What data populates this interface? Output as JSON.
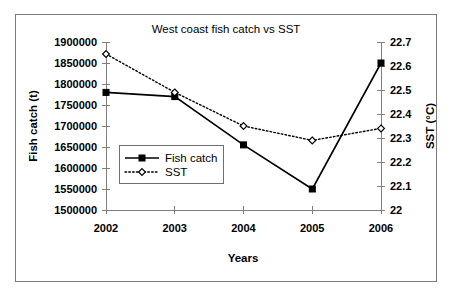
{
  "chart_data": {
    "type": "line",
    "title": "West coast fish catch vs SST",
    "xlabel": "Years",
    "ylabel": "Fish catch (t)",
    "y2label": "SST (°C)",
    "categories": [
      "2002",
      "2003",
      "2004",
      "2005",
      "2006"
    ],
    "x_tick_labels": [
      "2002",
      "2003",
      "2004",
      "2005",
      "2006"
    ],
    "ylim": [
      1500000,
      1900000
    ],
    "y_tick_labels": [
      "1900000",
      "1850000",
      "1800000",
      "1750000",
      "1700000",
      "1650000",
      "1600000",
      "1550000",
      "1500000"
    ],
    "y_tick_values": [
      1900000,
      1850000,
      1800000,
      1750000,
      1700000,
      1650000,
      1600000,
      1550000,
      1500000
    ],
    "y2lim": [
      22,
      22.7
    ],
    "y2_tick_labels": [
      "22.7",
      "22.6",
      "22.5",
      "22.4",
      "22.3",
      "22.2",
      "22.1",
      "22"
    ],
    "y2_tick_values": [
      22.7,
      22.6,
      22.5,
      22.4,
      22.3,
      22.2,
      22.1,
      22
    ],
    "grid": false,
    "legend_position": "center-left-inside",
    "series": [
      {
        "name": "Fish catch",
        "axis": "left",
        "line_style": "solid",
        "marker": "filled-square",
        "color": "#000000",
        "values": [
          1780000,
          1770000,
          1655000,
          1550000,
          1850000
        ]
      },
      {
        "name": "SST",
        "axis": "right",
        "line_style": "dotted",
        "marker": "open-diamond",
        "color": "#000000",
        "values": [
          22.65,
          22.49,
          22.35,
          22.29,
          22.34
        ]
      }
    ]
  },
  "legend": {
    "entries": [
      {
        "label": "Fish catch"
      },
      {
        "label": "SST"
      }
    ]
  },
  "colors": {
    "frame": "#7a7a7a",
    "axis": "#808080",
    "series": "#000000",
    "background": "#ffffff"
  }
}
